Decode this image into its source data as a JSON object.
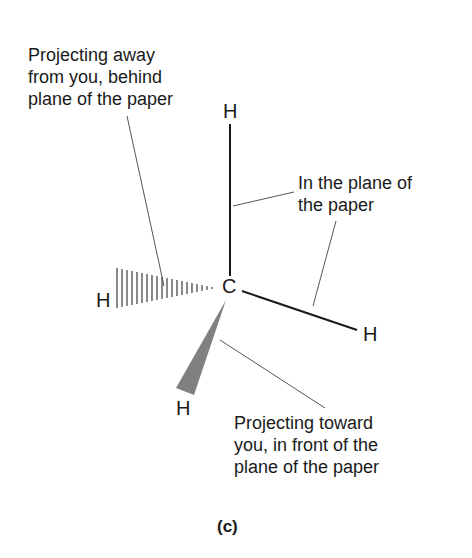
{
  "figure": {
    "caption": "(c)",
    "molecule": "CH4 wedge-dash representation",
    "atoms": {
      "center": "C",
      "top": "H",
      "right": "H",
      "left_dashed": "H",
      "bottom_wedge": "H"
    },
    "annotations": {
      "away": [
        "Projecting away",
        "from you, behind",
        "plane of the paper"
      ],
      "in_plane": [
        "In the plane of",
        "the paper"
      ],
      "toward": [
        "Projecting toward",
        "you, in front of the",
        "plane of the paper"
      ]
    },
    "colors": {
      "bond": "#1a1a1a",
      "leader_line": "#555555",
      "wedge": "#808080",
      "hash": "#8a8a8a"
    }
  }
}
